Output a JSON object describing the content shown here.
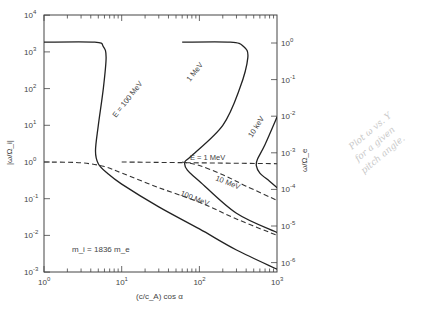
{
  "chart_data": {
    "type": "line",
    "title": "",
    "xlabel": "(c/c_A) cos α",
    "ylabel_left": "|ω/Ω_i|",
    "ylabel_right": "ω/Ω_e",
    "xscale": "log",
    "yscale": "log",
    "xlim": [
      1,
      1000
    ],
    "ylim_left": [
      0.001,
      10000
    ],
    "ylim_right": [
      1e-06,
      10
    ],
    "x_ticks": [
      "10^0",
      "10^1",
      "10^2",
      "10^3"
    ],
    "y_ticks_left": [
      "10^-3",
      "10^-2",
      "10^-1",
      "10^0",
      "10^1",
      "10^2",
      "10^3",
      "10^4"
    ],
    "y_ticks_right": [
      "10^-6",
      "10^-5",
      "10^-4",
      "10^-3",
      "10^-2",
      "10^-1",
      "10^0"
    ],
    "annotation": "m_i = 1836 m_e",
    "grid": false,
    "series": [
      {
        "name": "E = 100 MeV (solid)",
        "style": "solid",
        "points": [
          [
            1,
            1836
          ],
          [
            4.5,
            1836
          ],
          [
            5.8,
            1400
          ],
          [
            6.3,
            700
          ],
          [
            5.8,
            100
          ],
          [
            5.0,
            10
          ],
          [
            4.6,
            2
          ],
          [
            5.0,
            0.9
          ],
          [
            6.5,
            0.5
          ],
          [
            10,
            0.25
          ],
          [
            30,
            0.06
          ],
          [
            100,
            0.015
          ],
          [
            300,
            0.004
          ],
          [
            1000,
            0.0012
          ]
        ]
      },
      {
        "name": "E = 1 MeV (solid)",
        "style": "solid",
        "points": [
          [
            60,
            1836
          ],
          [
            250,
            1836
          ],
          [
            370,
            1400
          ],
          [
            420,
            700
          ],
          [
            330,
            100
          ],
          [
            200,
            10
          ],
          [
            80,
            1.5
          ],
          [
            65,
            1.0
          ],
          [
            70,
            0.6
          ],
          [
            100,
            0.3
          ],
          [
            300,
            0.04
          ],
          [
            1000,
            0.012
          ]
        ]
      },
      {
        "name": "E = 10 keV (solid)",
        "style": "solid",
        "points": [
          [
            1000,
            17
          ],
          [
            700,
            3
          ],
          [
            560,
            1.2
          ],
          [
            540,
            0.8
          ],
          [
            600,
            0.5
          ],
          [
            800,
            0.3
          ],
          [
            1000,
            0.2
          ]
        ]
      },
      {
        "name": "100 MeV (dashed)",
        "style": "dashed",
        "points": [
          [
            1,
            1
          ],
          [
            3,
            0.95
          ],
          [
            6,
            0.75
          ],
          [
            10,
            0.5
          ],
          [
            30,
            0.2
          ],
          [
            100,
            0.08
          ],
          [
            300,
            0.028
          ],
          [
            1000,
            0.01
          ]
        ]
      },
      {
        "name": "10 MeV (dashed)",
        "style": "dashed",
        "points": [
          [
            60,
            1
          ],
          [
            100,
            0.8
          ],
          [
            200,
            0.45
          ],
          [
            400,
            0.22
          ],
          [
            1000,
            0.09
          ]
        ]
      },
      {
        "name": "E = 1 MeV (dashed)",
        "style": "dashed",
        "points": [
          [
            10,
            1
          ],
          [
            1000,
            0.9
          ]
        ]
      }
    ],
    "curve_labels": [
      "E = 100 MeV",
      "1 MeV",
      "10 keV",
      "E = 1 MeV",
      "10 MeV",
      "100 MeV"
    ]
  },
  "handwritten_note": [
    "Plot ω vs. Y",
    "for a given",
    "pitch angle."
  ]
}
